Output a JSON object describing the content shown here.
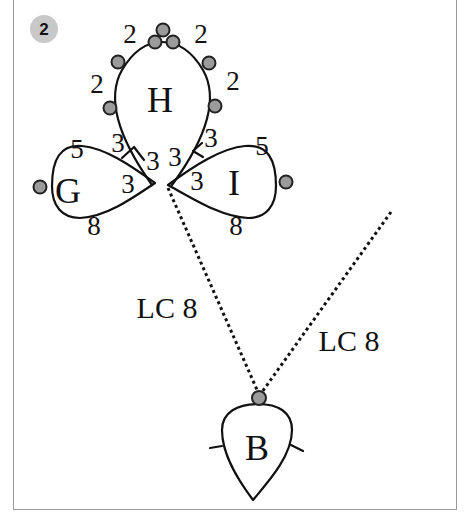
{
  "step_badge": {
    "label": "2",
    "color": "#c8c8c8"
  },
  "rings": {
    "H": {
      "label": "H",
      "stitch_counts": [
        "2",
        "2",
        "2",
        "2",
        "2",
        "2",
        "3",
        "3"
      ]
    },
    "G": {
      "label": "G",
      "stitch_counts": [
        "3",
        "5",
        "3",
        "8"
      ]
    },
    "I": {
      "label": "I",
      "stitch_counts": [
        "3",
        "5",
        "3",
        "8"
      ]
    },
    "B": {
      "label": "B"
    }
  },
  "labels": {
    "h_top_left": "2",
    "h_top_right": "2",
    "h_left": "2",
    "h_right": "2",
    "h_bottom_left": "3",
    "h_bottom_right": "3",
    "center_left": "3",
    "center_right": "3",
    "g_top": "5",
    "g_inner": "3",
    "g_bottom": "8",
    "i_top": "5",
    "i_inner": "3",
    "i_bottom": "8"
  },
  "chains": [
    {
      "label": "LC 8"
    },
    {
      "label": "LC 8"
    }
  ],
  "colors": {
    "picot_fill": "#9b9b9b",
    "line": "#111111",
    "frame": "#9a9a9a"
  }
}
